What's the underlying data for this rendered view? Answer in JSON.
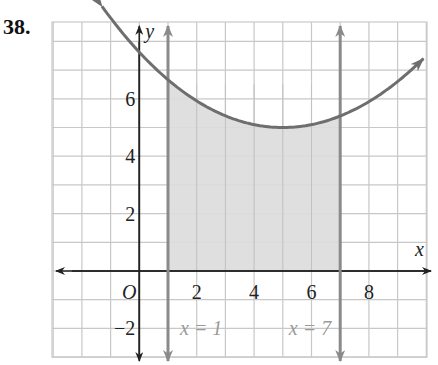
{
  "problem": {
    "number": "38."
  },
  "chart_data": {
    "type": "line",
    "title": "",
    "xlabel": "x",
    "ylabel": "y",
    "origin_label": "O",
    "xlim": [
      -3,
      10
    ],
    "ylim": [
      -3,
      9
    ],
    "grid": true,
    "x_ticks": [
      {
        "value": 2,
        "label": "2"
      },
      {
        "value": 4,
        "label": "4"
      },
      {
        "value": 6,
        "label": "6"
      },
      {
        "value": 8,
        "label": "8"
      }
    ],
    "y_ticks": [
      {
        "value": -2,
        "label": "−2"
      },
      {
        "value": 2,
        "label": "2"
      },
      {
        "value": 4,
        "label": "4"
      },
      {
        "value": 6,
        "label": "6"
      }
    ],
    "curve": {
      "description": "Upward-opening parabola with minimum near (5, 5)",
      "x": [
        -1.3,
        0,
        1,
        2,
        3,
        4,
        5,
        6,
        7,
        8,
        9,
        9.9
      ],
      "y": [
        9.2,
        7.5,
        6.6,
        5.9,
        5.4,
        5.1,
        5.0,
        5.1,
        5.4,
        6.0,
        6.8,
        7.7
      ]
    },
    "vertical_lines": [
      {
        "x": 1,
        "label": "x = 1"
      },
      {
        "x": 7,
        "label": "x = 7"
      }
    ],
    "shaded_region": {
      "x_from": 1,
      "x_to": 7,
      "between": "x-axis and curve"
    },
    "colors": {
      "curve": "#6e6e6e",
      "vertical_lines": "#8a8a8a",
      "shade": "#dcdcdc",
      "grid": "#c8c8c8",
      "axes": "#222222",
      "line_labels": "#9a9a9a"
    }
  }
}
